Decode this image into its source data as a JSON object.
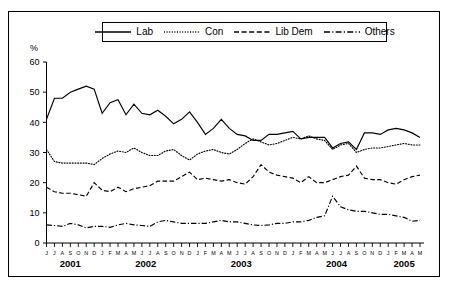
{
  "chart_data": {
    "type": "line",
    "title": "",
    "xlabel": "",
    "ylabel": "%",
    "ylim": [
      0,
      60
    ],
    "yticks": [
      0,
      10,
      20,
      30,
      40,
      50,
      60
    ],
    "grid": false,
    "legend_position": "top-center",
    "x": [
      "J",
      "J",
      "A",
      "S",
      "O",
      "N",
      "D",
      "J",
      "F",
      "M",
      "A",
      "M",
      "J",
      "J",
      "A",
      "S",
      "O",
      "N",
      "D",
      "J",
      "F",
      "M",
      "A",
      "M",
      "J",
      "J",
      "A",
      "S",
      "O",
      "N",
      "D",
      "J",
      "F",
      "M",
      "A",
      "M",
      "J",
      "J",
      "A",
      "S",
      "O",
      "N",
      "D",
      "J",
      "F",
      "M",
      "A",
      "M"
    ],
    "year_groups": [
      {
        "label": "2001",
        "count": 7
      },
      {
        "label": "2002",
        "count": 12
      },
      {
        "label": "2003",
        "count": 12
      },
      {
        "label": "2004",
        "count": 12
      },
      {
        "label": "2005",
        "count": 5
      }
    ],
    "series": [
      {
        "name": "Lab",
        "style": "solid",
        "values": [
          41,
          48,
          48,
          50,
          51,
          52,
          51,
          43,
          46.5,
          47.5,
          42.5,
          46,
          43,
          42.5,
          44,
          42,
          39.5,
          41,
          43.5,
          40,
          36,
          38,
          41,
          38,
          36,
          35.5,
          34,
          34,
          36,
          36,
          36.5,
          37,
          34.5,
          35,
          35,
          35,
          31.5,
          33,
          33.5,
          31,
          36.5,
          36.5,
          36,
          37.5,
          38,
          37.5,
          36.5,
          35
        ]
      },
      {
        "name": "Con",
        "style": "dotted",
        "values": [
          31,
          27,
          26.5,
          26.5,
          26.5,
          26.5,
          26,
          28,
          29.5,
          30.5,
          30,
          31.5,
          30,
          29,
          29,
          30.5,
          31,
          29,
          27.5,
          29.5,
          30.5,
          31,
          30,
          29.5,
          31,
          33,
          34.5,
          33.5,
          32.5,
          33,
          34,
          35,
          34.5,
          35.5,
          34.5,
          34,
          31,
          32.5,
          33,
          30,
          31,
          31.5,
          31.5,
          32,
          32.5,
          33,
          32.5,
          32.5
        ]
      },
      {
        "name": "Lib Dem",
        "style": "dashed",
        "values": [
          18.5,
          17,
          16.5,
          16.5,
          16,
          15.5,
          20,
          17.5,
          17,
          18.5,
          17,
          18,
          18.5,
          19,
          20.5,
          20.5,
          20.5,
          22,
          23.5,
          21,
          21.5,
          21,
          20.5,
          21,
          20,
          19.5,
          22,
          26,
          23.5,
          22.5,
          22,
          21.5,
          20,
          22,
          20,
          20,
          21,
          22,
          22.5,
          25.5,
          21.5,
          21,
          21,
          20,
          19.5,
          21,
          22,
          22.5
        ]
      },
      {
        "name": "Others",
        "style": "dashdot",
        "values": [
          6,
          5.8,
          5.5,
          6.5,
          6,
          5,
          5.5,
          5.5,
          5.2,
          6,
          6.5,
          6,
          5.8,
          5.5,
          7,
          7.5,
          7,
          6.5,
          6.5,
          6.5,
          6.5,
          7,
          7.5,
          7,
          7,
          6.5,
          6,
          5.8,
          6,
          6.5,
          6.5,
          7,
          7,
          7.5,
          8.5,
          9,
          15.5,
          12,
          11,
          10.5,
          10.5,
          10,
          9.5,
          9.5,
          9,
          8.5,
          7.2,
          7.5
        ]
      }
    ]
  },
  "legend": {
    "entries": [
      {
        "label": "Lab",
        "style": "solid"
      },
      {
        "label": "Con",
        "style": "dotted"
      },
      {
        "label": "Lib Dem",
        "style": "dashed"
      },
      {
        "label": "Others",
        "style": "dashdot"
      }
    ]
  },
  "axis": {
    "y_unit": "%"
  },
  "colors": {
    "line": "#000000",
    "frame": "#000000",
    "background": "#ffffff"
  }
}
